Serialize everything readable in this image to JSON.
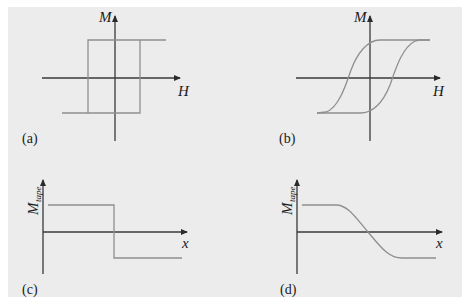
{
  "figure": {
    "panels": [
      {
        "id": "a",
        "label": "(a)",
        "y_axis_label": "M",
        "x_axis_label": "H",
        "description": "Square hysteresis loop"
      },
      {
        "id": "b",
        "label": "(b)",
        "y_axis_label": "M",
        "x_axis_label": "H",
        "description": "Sloped (S-shaped) hysteresis loop"
      },
      {
        "id": "c",
        "label": "(c)",
        "y_axis_label": "M",
        "y_axis_subscript": "tape",
        "x_axis_label": "x",
        "description": "Abrupt step transition of tape magnetization"
      },
      {
        "id": "d",
        "label": "(d)",
        "y_axis_label": "M",
        "y_axis_subscript": "tape",
        "x_axis_label": "x",
        "description": "Gradual transition of tape magnetization"
      }
    ]
  },
  "colors": {
    "background": "#ececec",
    "axis": "#3a3a3a",
    "curve": "#8f8f8f"
  }
}
